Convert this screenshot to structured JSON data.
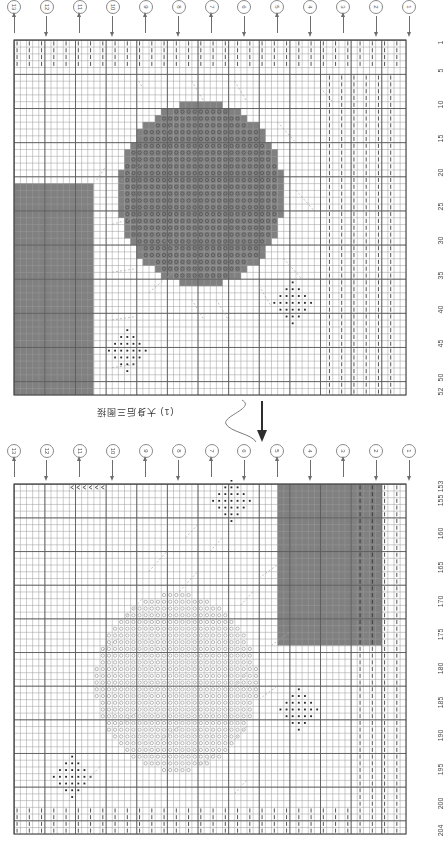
{
  "document": {
    "kind": "knitting-chart",
    "mid_note": "(1) 大身后三图接",
    "mid_note_rotated": true
  },
  "palette": {
    "grid_line": "#9a9a9a",
    "grid_major": "#5a5a5a",
    "fill_gray": "#808080",
    "symbol_dark": "#2a2a2a",
    "symbol_light": "#8d8d8d",
    "paper": "#ffffff",
    "text": "#4a4a4a"
  },
  "legend_symbols": [
    {
      "name": "knit-bar",
      "glyph": "|",
      "meaning": "vertical bar stitch"
    },
    {
      "name": "open-circle",
      "glyph": "o",
      "meaning": "circle stitch"
    },
    {
      "name": "solid-dot",
      "glyph": "•",
      "meaning": "dot stitch"
    },
    {
      "name": "left-chevron",
      "glyph": "<",
      "meaning": "decrease"
    },
    {
      "name": "gray-block",
      "glyph": "",
      "meaning": "solid colour block"
    }
  ],
  "charts": [
    {
      "id": "chart-top",
      "columns": 64,
      "rows": 52,
      "markers": [
        {
          "label": "13",
          "direction": "up"
        },
        {
          "label": "12",
          "direction": "down"
        },
        {
          "label": "11",
          "direction": "up"
        },
        {
          "label": "10",
          "direction": "down"
        },
        {
          "label": "9",
          "direction": "up"
        },
        {
          "label": "8",
          "direction": "down"
        },
        {
          "label": "7",
          "direction": "up"
        },
        {
          "label": "6",
          "direction": "down"
        },
        {
          "label": "5",
          "direction": "up"
        },
        {
          "label": "4",
          "direction": "down"
        },
        {
          "label": "3",
          "direction": "up"
        },
        {
          "label": "2",
          "direction": "down"
        },
        {
          "label": "1",
          "direction": "down"
        }
      ],
      "row_labels": [
        "1",
        "5",
        "10",
        "15",
        "20",
        "25",
        "30",
        "35",
        "40",
        "45",
        "50",
        "52"
      ],
      "row_label_rows": [
        1,
        5,
        10,
        15,
        20,
        25,
        30,
        35,
        40,
        45,
        50,
        52
      ]
    },
    {
      "id": "chart-bottom",
      "columns": 64,
      "rows": 52,
      "markers": [
        {
          "label": "13",
          "direction": "up"
        },
        {
          "label": "12",
          "direction": "down"
        },
        {
          "label": "11",
          "direction": "up"
        },
        {
          "label": "10",
          "direction": "down"
        },
        {
          "label": "9",
          "direction": "up"
        },
        {
          "label": "8",
          "direction": "down"
        },
        {
          "label": "7",
          "direction": "up"
        },
        {
          "label": "6",
          "direction": "down"
        },
        {
          "label": "5",
          "direction": "up"
        },
        {
          "label": "4",
          "direction": "down"
        },
        {
          "label": "3",
          "direction": "up"
        },
        {
          "label": "2",
          "direction": "down"
        },
        {
          "label": "1",
          "direction": "down"
        }
      ],
      "row_labels": [
        "153",
        "155",
        "160",
        "165",
        "170",
        "175",
        "180",
        "185",
        "190",
        "195",
        "200",
        "204"
      ],
      "row_label_rows": [
        1,
        3,
        8,
        13,
        18,
        23,
        28,
        33,
        38,
        43,
        48,
        52
      ]
    }
  ],
  "chart_data": {
    "type": "heatmap",
    "xlabel": "stitch column",
    "ylabel": "row",
    "grid": true,
    "legend_position": "none",
    "panels": [
      {
        "name": "top-panel",
        "rows": 52,
        "columns": 64,
        "row_ticks": [
          1,
          5,
          10,
          15,
          20,
          25,
          30,
          35,
          40,
          45,
          50,
          52
        ],
        "row_tick_labels": [
          "1",
          "5",
          "10",
          "15",
          "20",
          "25",
          "30",
          "35",
          "40",
          "45",
          "50",
          "52"
        ],
        "regions": [
          {
            "kind": "bar-rows",
            "rows": [
              1,
              4
            ],
            "cols": [
              1,
              64
            ],
            "symbol": "knit-bar"
          },
          {
            "kind": "gray-circle",
            "center_col": 31,
            "center_row": 23,
            "radius": 13,
            "symbol": "open-circle",
            "fill": "#808080"
          },
          {
            "kind": "gray-block",
            "rows": [
              22,
              52
            ],
            "cols": [
              1,
              13
            ],
            "fill": "#808080"
          },
          {
            "kind": "dot-diamond",
            "center_col": 46,
            "center_row": 39,
            "radius": 3,
            "symbol": "solid-dot"
          },
          {
            "kind": "dot-diamond",
            "center_col": 19,
            "center_row": 46,
            "radius": 3,
            "symbol": "solid-dot"
          },
          {
            "kind": "bar-cols",
            "cols": [
              52,
              62
            ],
            "rows": [
              6,
              52
            ],
            "symbol": "knit-bar"
          }
        ]
      },
      {
        "name": "bottom-panel",
        "rows": 52,
        "columns": 64,
        "row_ticks": [
          1,
          3,
          8,
          13,
          18,
          23,
          28,
          33,
          38,
          43,
          48,
          52
        ],
        "row_tick_labels": [
          "153",
          "155",
          "160",
          "165",
          "170",
          "175",
          "180",
          "185",
          "190",
          "195",
          "200",
          "204"
        ],
        "regions": [
          {
            "kind": "chevrons",
            "row": 1,
            "cols": [
              10,
              15
            ],
            "symbol": "left-chevron"
          },
          {
            "kind": "circle-outline",
            "center_col": 27,
            "center_row": 30,
            "radius": 13,
            "symbol": "open-circle"
          },
          {
            "kind": "gray-block",
            "rows": [
              1,
              24
            ],
            "cols": [
              44,
              60
            ],
            "fill": "#808080"
          },
          {
            "kind": "dot-diamond",
            "center_col": 36,
            "center_row": 3,
            "radius": 3,
            "symbol": "solid-dot"
          },
          {
            "kind": "dot-diamond",
            "center_col": 47,
            "center_row": 34,
            "radius": 3,
            "symbol": "solid-dot"
          },
          {
            "kind": "dot-diamond",
            "center_col": 10,
            "center_row": 44,
            "radius": 3,
            "symbol": "solid-dot"
          },
          {
            "kind": "bar-rows",
            "rows": [
              49,
              52
            ],
            "cols": [
              1,
              64
            ],
            "symbol": "knit-bar"
          },
          {
            "kind": "bar-cols",
            "cols": [
              57,
              63
            ],
            "rows": [
              1,
              48
            ],
            "symbol": "knit-bar"
          }
        ]
      }
    ]
  }
}
